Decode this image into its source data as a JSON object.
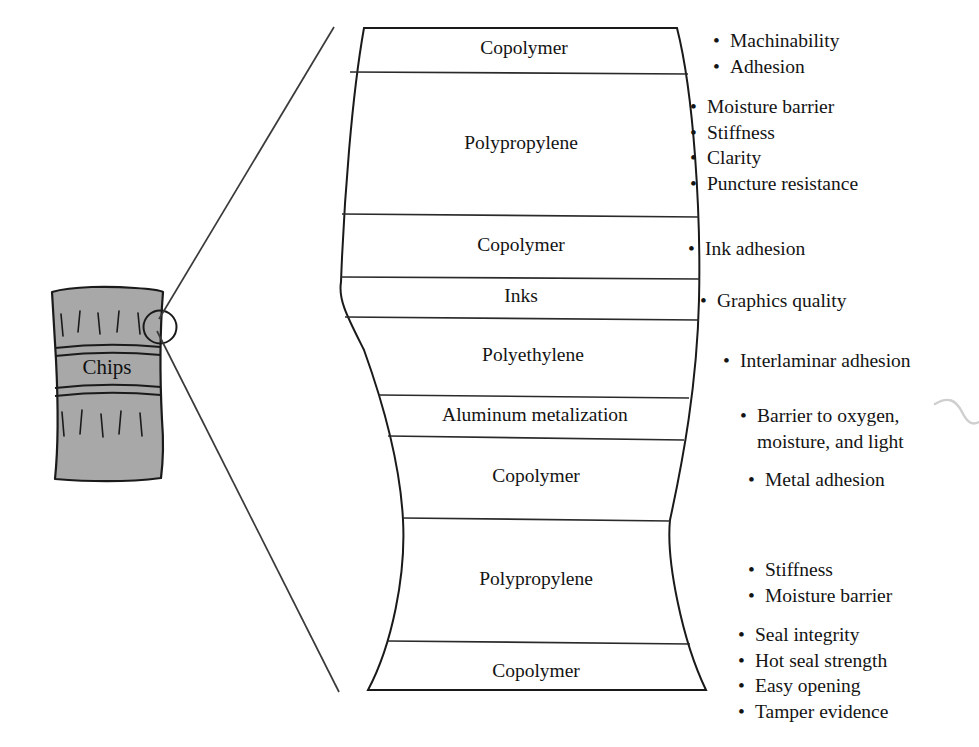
{
  "figure": {
    "bag": {
      "label": "Chips",
      "fill_color": "#a8a8a8",
      "stroke_color": "#1a1a1a"
    },
    "callout": {
      "magnifier_icon": "magnifier-circle",
      "leader_line_count": 2
    },
    "squiggle_icon": "wavy-squiggle-mark"
  },
  "layers": [
    {
      "name": "Copolymer"
    },
    {
      "name": "Polypropylene"
    },
    {
      "name": "Copolymer"
    },
    {
      "name": "Inks"
    },
    {
      "name": "Polyethylene"
    },
    {
      "name": "Aluminum metalization"
    },
    {
      "name": "Copolymer"
    },
    {
      "name": "Polypropylene"
    },
    {
      "name": "Copolymer"
    }
  ],
  "annotations": [
    {
      "for_layer": "Copolymer",
      "items": [
        "Machinability",
        "Adhesion"
      ]
    },
    {
      "for_layer": "Polypropylene",
      "items": [
        "Moisture barrier",
        "Stiffness",
        "Clarity",
        "Puncture resistance"
      ]
    },
    {
      "for_layer": "Copolymer",
      "items": [
        "Ink adhesion"
      ]
    },
    {
      "for_layer": "Inks",
      "items": [
        "Graphics quality"
      ]
    },
    {
      "for_layer": "Polyethylene",
      "items": [
        "Interlaminar adhesion"
      ]
    },
    {
      "for_layer": "Aluminum metalization",
      "items": [
        "Barrier to oxygen,",
        "moisture, and light"
      ]
    },
    {
      "for_layer": "Copolymer",
      "items": [
        "Metal adhesion"
      ]
    },
    {
      "for_layer": "Polypropylene",
      "items": [
        "Stiffness",
        "Moisture barrier"
      ]
    },
    {
      "for_layer": "Copolymer",
      "items": [
        "Seal integrity",
        "Hot seal strength",
        "Easy opening",
        "Tamper evidence"
      ]
    }
  ]
}
